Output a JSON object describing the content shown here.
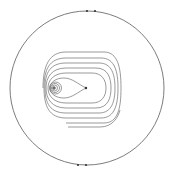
{
  "diagram": {
    "type": "phase-portrait",
    "colors": {
      "background": "#ffffff",
      "curve": "#6e6e6e",
      "boundary": "#5a5a5a",
      "point": "#333333"
    },
    "boundary_circle": {
      "cx": 87,
      "cy": 88,
      "r": 77
    },
    "boundary_marks": [
      {
        "x": 87,
        "y": 11
      },
      {
        "x": 95,
        "y": 11
      },
      {
        "x": 78,
        "y": 165
      },
      {
        "x": 86,
        "y": 165
      }
    ],
    "singular_points": [
      {
        "kind": "focus",
        "x": 54,
        "y": 88
      },
      {
        "kind": "cusp",
        "x": 86,
        "y": 88
      }
    ]
  }
}
